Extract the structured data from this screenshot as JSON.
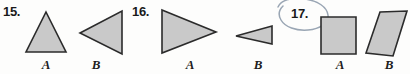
{
  "page": {
    "background_color": "#fdfdfc",
    "shape_fill_color": "#c9c9c9",
    "shape_stroke_color": "#2b2b2b",
    "annotation_color": "#9aa6b4"
  },
  "problems": [
    {
      "number": "15.",
      "figures": [
        {
          "label": "A",
          "shape": "triangle-up"
        },
        {
          "label": "B",
          "shape": "triangle-left"
        }
      ]
    },
    {
      "number": "16.",
      "figures": [
        {
          "label": "A",
          "shape": "triangle-right-large"
        },
        {
          "label": "B",
          "shape": "triangle-left-small"
        }
      ]
    },
    {
      "number": "17.",
      "annotation": "hand-drawn-circle",
      "figures": [
        {
          "label": "A",
          "shape": "square"
        },
        {
          "label": "B",
          "shape": "parallelogram"
        }
      ]
    }
  ]
}
